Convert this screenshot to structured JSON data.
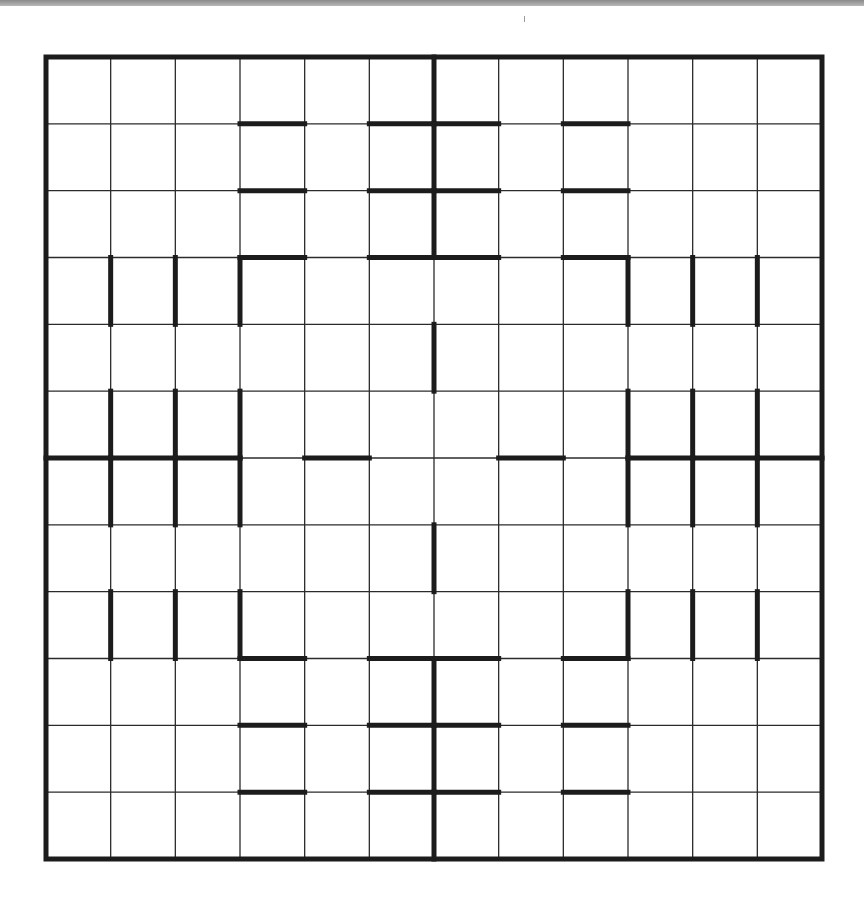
{
  "puzzle": {
    "type": "region-division grid",
    "rows": 12,
    "cols": 12,
    "colors": {
      "background": "#ffffff",
      "grid_line": "#2b2b2b",
      "region_border": "#1c1c1c",
      "top_bar": "#9a9a9a"
    },
    "bold_horizontal_edges": [
      {
        "row_line": 1,
        "cols": [
          3,
          5,
          6,
          8
        ]
      },
      {
        "row_line": 2,
        "cols": [
          3,
          5,
          6,
          8
        ]
      },
      {
        "row_line": 3,
        "cols": [
          3,
          5,
          6,
          8
        ]
      },
      {
        "row_line": 6,
        "cols": [
          0,
          1,
          2,
          4,
          7,
          9,
          10,
          11
        ]
      },
      {
        "row_line": 9,
        "cols": [
          3,
          5,
          6,
          8
        ]
      },
      {
        "row_line": 10,
        "cols": [
          3,
          5,
          6,
          8
        ]
      },
      {
        "row_line": 11,
        "cols": [
          3,
          5,
          6,
          8
        ]
      }
    ],
    "bold_vertical_edges": [
      {
        "col_line": 6,
        "rows": [
          0,
          1,
          2,
          4,
          7,
          9,
          10,
          11
        ]
      },
      {
        "col_line": 1,
        "rows": [
          3,
          5,
          6,
          8
        ]
      },
      {
        "col_line": 2,
        "rows": [
          3,
          5,
          6,
          8
        ]
      },
      {
        "col_line": 3,
        "rows": [
          3,
          5,
          6,
          8
        ]
      },
      {
        "col_line": 9,
        "rows": [
          3,
          5,
          6,
          8
        ]
      },
      {
        "col_line": 10,
        "rows": [
          3,
          5,
          6,
          8
        ]
      },
      {
        "col_line": 11,
        "rows": [
          3,
          5,
          6,
          8
        ]
      }
    ]
  }
}
